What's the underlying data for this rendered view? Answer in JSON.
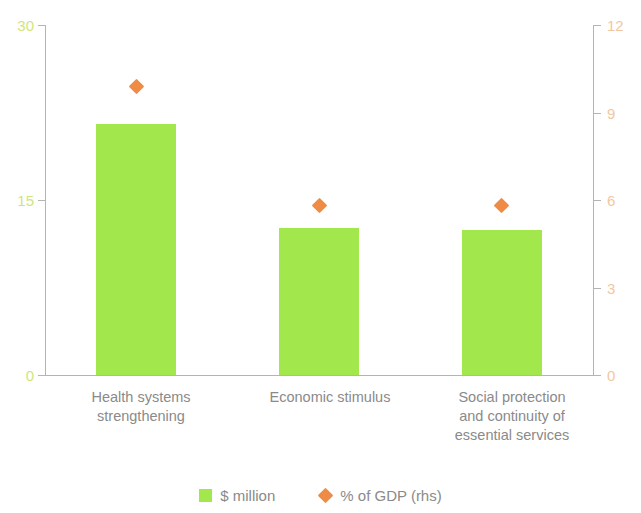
{
  "chart_data": {
    "type": "bar",
    "title": "",
    "subtitle": "",
    "xlabel": "",
    "ylabel": "",
    "y2label": "",
    "categories": [
      "Health systems\nstrengthening",
      "Economic stimulus",
      "Social protection\nand continuity of\nessential services"
    ],
    "series": [
      {
        "name": "$ million",
        "type": "bar",
        "axis": "left",
        "color": "#a2e84d",
        "values": [
          21.5,
          12.6,
          12.4
        ]
      },
      {
        "name": "% of GDP (rhs)",
        "type": "scatter",
        "marker": "diamond",
        "axis": "right",
        "color": "#ef8b44",
        "values": [
          9.9,
          5.8,
          5.8
        ]
      }
    ],
    "ylim": [
      0,
      30
    ],
    "yticks": [
      0,
      15,
      30
    ],
    "ytick_labels": [
      "0",
      "15",
      "30"
    ],
    "y2lim": [
      0,
      12
    ],
    "y2ticks": [
      0,
      3,
      6,
      9,
      12
    ],
    "y2tick_labels": [
      "0",
      "3",
      "6",
      "9",
      "12"
    ],
    "grid": false,
    "legend_position": "bottom",
    "axis_left_color": "#cfe57a",
    "axis_right_color": "#f3c79d",
    "category_label_color": "#8a8a8a"
  },
  "axes": {
    "left": {
      "ticks": [
        {
          "label": "30",
          "value": 30
        },
        {
          "label": "15",
          "value": 15
        },
        {
          "label": "0",
          "value": 0
        }
      ]
    },
    "right": {
      "ticks": [
        {
          "label": "12",
          "value": 12
        },
        {
          "label": "9",
          "value": 9
        },
        {
          "label": "6",
          "value": 6
        },
        {
          "label": "3",
          "value": 3
        },
        {
          "label": "0",
          "value": 0
        }
      ]
    }
  },
  "categories": [
    {
      "label": "Health systems\nstrengthening"
    },
    {
      "label": "Economic stimulus"
    },
    {
      "label": "Social protection\nand continuity of\nessential services"
    }
  ],
  "legend": {
    "items": [
      {
        "label": "$ million",
        "marker": "square",
        "color": "#a2e84d"
      },
      {
        "label": "% of GDP (rhs)",
        "marker": "diamond",
        "color": "#ef8b44"
      }
    ]
  }
}
